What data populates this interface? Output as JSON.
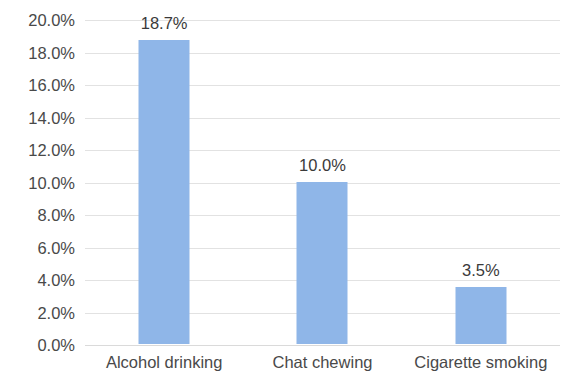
{
  "chart_data": {
    "type": "bar",
    "title": "",
    "subtitle": "",
    "xlabel": "",
    "ylabel": "",
    "categories": [
      "Alcohol drinking",
      "Chat chewing",
      "Cigarette smoking"
    ],
    "values": [
      18.7,
      10.0,
      3.5
    ],
    "data_labels": [
      "18.7%",
      "10.0%",
      "3.5%"
    ],
    "ylim": [
      0,
      20
    ],
    "ytick_values": [
      20,
      18,
      16,
      14,
      12,
      10,
      8,
      6,
      4,
      2,
      0
    ],
    "ytick_labels": [
      "20.0%",
      "18.0%",
      "16.0%",
      "14.0%",
      "12.0%",
      "10.0%",
      "8.0%",
      "6.0%",
      "4.0%",
      "2.0%",
      "0.0%"
    ],
    "grid": true,
    "grid_axis": "y",
    "legend": false,
    "legend_position": "none",
    "series": [
      {
        "name": "",
        "values": [
          18.7,
          10.0,
          3.5
        ],
        "color": "#8FB6E8"
      }
    ]
  },
  "colors": {
    "bar_fill": "#8FB6E8",
    "gridline": "#E2E2E2",
    "tick_text": "#494949",
    "label_text": "#3A3A3A",
    "background": "#FFFFFF"
  }
}
